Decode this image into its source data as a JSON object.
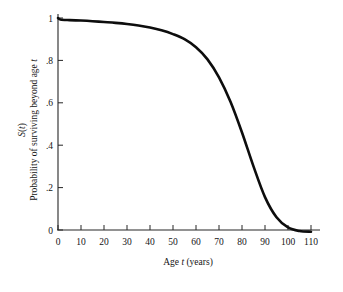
{
  "chart_data": {
    "type": "line",
    "title": "",
    "subtitle": "",
    "xlabel": "Age t (years)",
    "xlabel_parts": [
      "Age ",
      "t",
      " (years)"
    ],
    "ylabel": "Probability of surviving beyond age t",
    "ylabel_parts": [
      "Probability of surviving beyond age ",
      "t"
    ],
    "ylabel_symbol": "S(t)",
    "ylabel_symbol_parts": [
      "S",
      "(",
      "t",
      ")"
    ],
    "xlim": [
      0,
      110
    ],
    "ylim": [
      0,
      1
    ],
    "xticks": [
      0,
      10,
      20,
      30,
      40,
      50,
      60,
      70,
      80,
      90,
      100,
      110
    ],
    "xtick_labels": [
      "0",
      "10",
      "20",
      "30",
      "40",
      "50",
      "60",
      "70",
      "80",
      "90",
      "100",
      "110"
    ],
    "yticks": [
      0,
      0.2,
      0.4,
      0.6,
      0.8,
      1
    ],
    "ytick_labels": [
      "0",
      ".2",
      ".4",
      ".6",
      ".8",
      "1"
    ],
    "grid": false,
    "legend": "none",
    "series": [
      {
        "name": "S(t)",
        "color": "#0d0d0d",
        "x": [
          0,
          1,
          5,
          10,
          15,
          20,
          25,
          30,
          35,
          40,
          45,
          50,
          55,
          60,
          65,
          70,
          75,
          80,
          85,
          90,
          95,
          100,
          105,
          110
        ],
        "y": [
          1.0,
          0.993,
          0.99,
          0.988,
          0.985,
          0.981,
          0.977,
          0.972,
          0.965,
          0.955,
          0.942,
          0.924,
          0.9,
          0.862,
          0.805,
          0.72,
          0.605,
          0.46,
          0.3,
          0.155,
          0.06,
          0.012,
          -0.005,
          -0.008
        ]
      }
    ]
  },
  "axes": {
    "x_origin_px": 58,
    "y_origin_px": 230,
    "x_span_px": 253,
    "y_span_px": 212
  }
}
